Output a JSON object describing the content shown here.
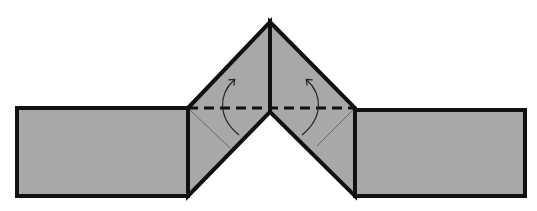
{
  "diagram": {
    "colors": {
      "paper_fill": "#a8a8a8",
      "outline": "#111111",
      "crease": "#555555",
      "background": "#ffffff"
    },
    "elements": {
      "left_rect": {
        "x": 17,
        "y": 108,
        "w": 171,
        "h": 88
      },
      "right_rect": {
        "x": 355,
        "y": 110,
        "w": 170,
        "h": 86
      },
      "apex": {
        "x": 270,
        "y": 22
      },
      "notch": {
        "x": 270,
        "y": 112
      },
      "fold_line_y": 108,
      "fold_line_style": "dashed",
      "arrows": [
        {
          "side": "left",
          "direction": "up",
          "label": "fold-up"
        },
        {
          "side": "right",
          "direction": "up",
          "label": "fold-up"
        }
      ]
    }
  }
}
